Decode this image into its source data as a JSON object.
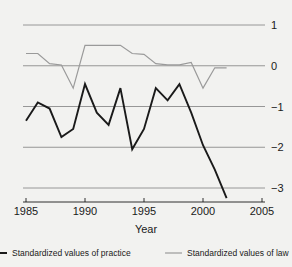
{
  "chart_data": {
    "type": "line",
    "title": "",
    "xlabel": "Year",
    "ylabel": "",
    "xlim": [
      1985,
      2005
    ],
    "ylim": [
      -3.4,
      1.3
    ],
    "grid": true,
    "grid_orientation": "horizontal",
    "legend_position": "bottom",
    "x": [
      1985,
      1986,
      1987,
      1988,
      1989,
      1990,
      1991,
      1992,
      1993,
      1994,
      1995,
      1996,
      1997,
      1998,
      1999,
      2000,
      2001,
      2002
    ],
    "xticks": [
      1985,
      1990,
      1995,
      2000,
      2005
    ],
    "xtick_labels": [
      "1985",
      "1990",
      "1995",
      "2000",
      "2005"
    ],
    "yticks": [
      1,
      0,
      -1,
      -2,
      -3
    ],
    "ytick_labels": [
      "1",
      "0",
      "−1",
      "−2",
      "−3"
    ],
    "ytick_side": "right",
    "series": [
      {
        "name": "Standardized values of practice",
        "color": "#1a1a1a",
        "width": 1.9,
        "x": [
          1985,
          1986,
          1987,
          1988,
          1989,
          1990,
          1991,
          1992,
          1993,
          1994,
          1995,
          1996,
          1997,
          1998,
          1999,
          2000,
          2001,
          2002
        ],
        "values": [
          -1.35,
          -0.9,
          -1.05,
          -1.75,
          -1.55,
          -0.45,
          -1.15,
          -1.45,
          -0.55,
          -2.05,
          -1.55,
          -0.55,
          -0.85,
          -0.45,
          -1.15,
          -1.95,
          -2.55,
          -3.25
        ]
      },
      {
        "name": "Standardized values of law",
        "color": "#9a9a9a",
        "width": 1.2,
        "x": [
          1985,
          1986,
          1987,
          1988,
          1989,
          1990,
          1991,
          1992,
          1993,
          1994,
          1995,
          1996,
          1997,
          1998,
          1999,
          2000,
          2001,
          2002
        ],
        "values": [
          0.3,
          0.3,
          0.05,
          0.02,
          -0.55,
          0.5,
          0.5,
          0.5,
          0.5,
          0.3,
          0.28,
          0.05,
          0.02,
          0.02,
          0.08,
          -0.55,
          -0.05,
          -0.05
        ]
      }
    ]
  },
  "legend": {
    "items": [
      {
        "label": "Standardized values of practice",
        "color": "#1a1a1a"
      },
      {
        "label": "Standardized values of law",
        "color": "#9a9a9a"
      }
    ]
  },
  "colors": {
    "background": "#f2f2f0",
    "grid": "#8c8c8c",
    "axis": "#1a1a1a",
    "practice": "#1a1a1a",
    "law": "#9a9a9a"
  }
}
